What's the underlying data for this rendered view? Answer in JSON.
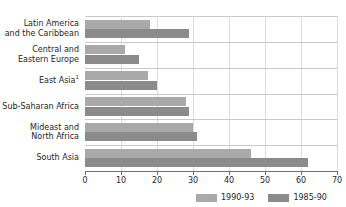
{
  "chart_data": {
    "type": "bar",
    "orientation": "horizontal",
    "title": "",
    "xlabel": "",
    "ylabel": "",
    "xlim": [
      0,
      70
    ],
    "xticks": [
      0,
      10,
      20,
      30,
      40,
      50,
      60,
      70
    ],
    "grid": true,
    "legend_position": "bottom-right",
    "categories": [
      "Latin America and the Caribbean",
      "Central and Eastern Europe",
      "East Asia",
      "Sub-Saharan Africa",
      "Mideast and North Africa",
      "South Asia"
    ],
    "category_lines": [
      [
        "Latin America",
        "and the Caribbean"
      ],
      [
        "Central and",
        "Eastern Europe"
      ],
      [
        "East Asia"
      ],
      [
        "Sub-Saharan Africa"
      ],
      [
        "Mideast and",
        "North Africa"
      ],
      [
        "South Asia"
      ]
    ],
    "category_footnotes": [
      "",
      "",
      "1",
      "",
      "",
      ""
    ],
    "series": [
      {
        "name": "1990-93",
        "color": "#a9a9a9",
        "values": [
          18,
          11,
          17.5,
          28,
          30,
          46
        ]
      },
      {
        "name": "1985-90",
        "color": "#8b8b8b",
        "values": [
          29,
          15,
          20,
          29,
          31,
          62
        ]
      }
    ]
  },
  "legend": {
    "items": [
      {
        "label": "1990-93",
        "color": "#a9a9a9"
      },
      {
        "label": "1985-90",
        "color": "#8b8b8b"
      }
    ]
  },
  "axis": {
    "tick_labels": [
      "0",
      "10",
      "20",
      "30",
      "40",
      "50",
      "60",
      "70"
    ]
  }
}
